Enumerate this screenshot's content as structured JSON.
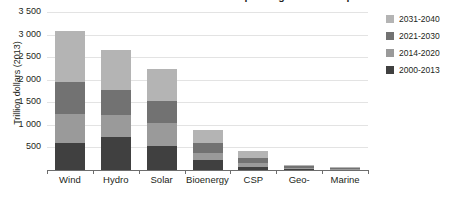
{
  "chart_data": {
    "type": "bar",
    "stacked": true,
    "title": "Cumulative investment in renewable power generation capacity by source in the New Policies Scenario",
    "xlabel": "",
    "ylabel": "Trillion dollars (2013)",
    "ylim": [
      0,
      3500
    ],
    "ytick_labels": [
      "3 500",
      "3 000",
      "2 500",
      "2 000",
      "1 500",
      "1 000",
      "500"
    ],
    "ytick_values": [
      3500,
      3000,
      2500,
      2000,
      1500,
      1000,
      500
    ],
    "grid": true,
    "legend_position": "right",
    "categories": [
      "Wind",
      "Hydro",
      "Solar",
      "Bioenergy",
      "CSP",
      "Geo-",
      "Marine"
    ],
    "series": [
      {
        "name": "2000-2013",
        "color": "#404040",
        "values": [
          590,
          730,
          530,
          220,
          60,
          20,
          10
        ]
      },
      {
        "name": "2014-2020",
        "color": "#9a9a9a",
        "values": [
          640,
          490,
          510,
          160,
          100,
          30,
          20
        ]
      },
      {
        "name": "2021-2030",
        "color": "#727272",
        "values": [
          710,
          560,
          490,
          210,
          110,
          30,
          20
        ]
      },
      {
        "name": "2031-2040",
        "color": "#b4b4b4",
        "values": [
          1130,
          870,
          700,
          300,
          160,
          30,
          20
        ]
      }
    ],
    "totals": [
      3070,
      2650,
      2230,
      890,
      430,
      110,
      70
    ]
  },
  "legend": {
    "items": [
      {
        "label": "2031-2040",
        "color": "#b4b4b4"
      },
      {
        "label": "2021-2030",
        "color": "#727272"
      },
      {
        "label": "2014-2020",
        "color": "#9a9a9a"
      },
      {
        "label": "2000-2013",
        "color": "#404040"
      }
    ]
  },
  "colors": {
    "grid": "#e3e3e3",
    "axis": "#6d6d6d",
    "text": "#231f20",
    "background": "#ffffff"
  }
}
